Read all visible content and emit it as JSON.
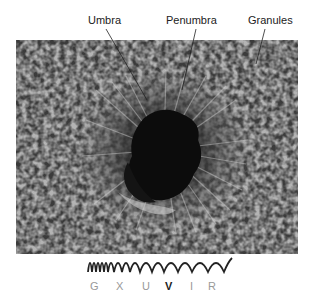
{
  "labels": {
    "umbra": "Umbra",
    "penumbra": "Penumbra",
    "granules": "Granules"
  },
  "spectrum": {
    "bands": [
      "G",
      "X",
      "U",
      "V",
      "I",
      "R"
    ],
    "highlighted": "V"
  },
  "colors": {
    "text": "#222222",
    "band_inactive": "#999999",
    "band_active": "#222222",
    "wave": "#222222"
  }
}
